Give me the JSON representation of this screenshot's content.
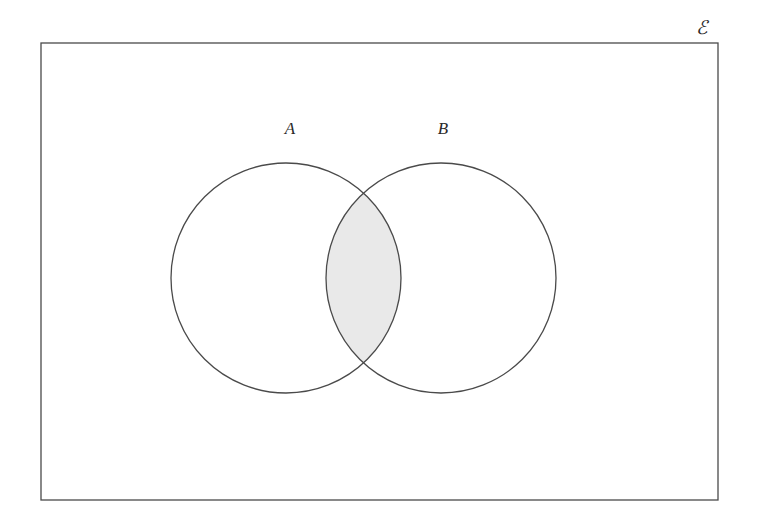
{
  "figure": {
    "kind": "venn-diagram",
    "caption_symbols": {
      "universe_label": "ℰ",
      "set_a_label": "A",
      "set_b_label": "B"
    },
    "background_color": "#ffffff",
    "stroke_color": "#4a4a4a",
    "intersection_fill_color": "#e9e9e9",
    "circle_fill_color": "#ffffff",
    "stroke_width": 1.3
  },
  "universe": {
    "label": "ℰ",
    "label_x": 702,
    "label_y": 27,
    "rect": {
      "x": 41,
      "y": 43,
      "width": 677,
      "height": 457
    }
  },
  "sets": [
    {
      "name": "A",
      "label": "A",
      "label_x": 290,
      "label_y": 128,
      "center_x": 286,
      "center_y": 278,
      "radius": 115,
      "shaded": false
    },
    {
      "name": "B",
      "label": "B",
      "label_x": 443,
      "label_y": 128,
      "center_x": 441,
      "center_y": 278,
      "radius": 115,
      "shaded": false
    }
  ],
  "regions": [
    {
      "name": "A only",
      "expression": "A \\ B",
      "shaded": false
    },
    {
      "name": "B only",
      "expression": "B \\ A",
      "shaded": false
    },
    {
      "name": "intersection",
      "expression": "A ∩ B",
      "shaded": true
    },
    {
      "name": "outside",
      "expression": "ℰ \\ (A ∪ B)",
      "shaded": false
    }
  ],
  "intersection": {
    "top_crossing_x": 369,
    "top_crossing_y": 193,
    "bottom_crossing_x": 369,
    "bottom_crossing_y": 363,
    "left_extent_x": 326,
    "right_extent_x": 401
  }
}
